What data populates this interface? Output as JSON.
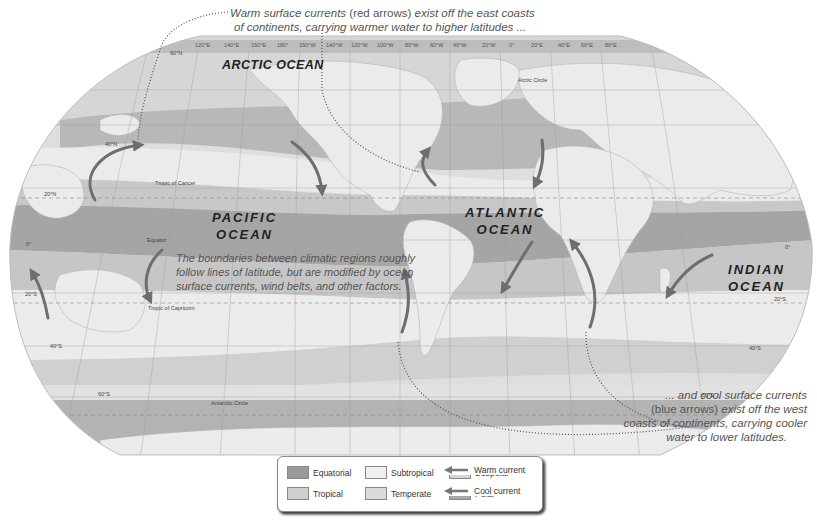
{
  "callouts": {
    "warm_line1_a": "Warm surface currents",
    "warm_line1_b": "(red arrows)",
    "warm_line1_c": "exist off the east coasts",
    "warm_line2": "of continents, carrying warmer water to higher latitudes ...",
    "cool_line1": "... and cool surface currents",
    "cool_line2_a": "(blue arrows)",
    "cool_line2_b": "exist off the west",
    "cool_line3": "coasts of continents,  carrying cooler",
    "cool_line4": "water to lower latitudes."
  },
  "oceans": {
    "arctic": "ARCTIC OCEAN",
    "pacific_1": "PACIFIC",
    "pacific_2": "OCEAN",
    "atlantic_1": "ATLANTIC",
    "atlantic_2": "OCEAN",
    "indian_1": "INDIAN",
    "indian_2": "OCEAN"
  },
  "note": {
    "line1": "The boundaries between climatic regions roughly",
    "line2": "follow lines of latitude, but are modified by ocean",
    "line3": "surface currents, wind belts, and other factors."
  },
  "reference_lines": {
    "tropic_cancer": "Tropic of Cancer",
    "tropic_capricorn": "Tropic of Capricorn",
    "equator": "Equator",
    "arctic_circle": "Arctic Circle",
    "antarctic_circle": "Antarctic Circle"
  },
  "latitudes": {
    "n60": "60°N",
    "n40": "40°N",
    "n20": "20°N",
    "eq_left": "0°",
    "eq_right": "0°",
    "s20_left": "20°S",
    "s20_right": "20°S",
    "s40_left": "40°S",
    "s40_right": "40°S",
    "s60_left": "60°S",
    "s60_right": "60°S"
  },
  "longitudes": [
    "120°E",
    "140°E",
    "160°E",
    "180°",
    "160°W",
    "140°W",
    "120°W",
    "100°W",
    "80°W",
    "60°W",
    "40°W",
    "20°W",
    "0°",
    "20°E",
    "40°E",
    "60°E",
    "80°E"
  ],
  "legend": {
    "items": [
      {
        "label": "Equatorial",
        "color": "#9a9a9a"
      },
      {
        "label": "Tropical",
        "color": "#cfcfcf"
      },
      {
        "label": "Subtropical",
        "color": "#f0f0f0"
      },
      {
        "label": "Temperate",
        "color": "#dadada"
      },
      {
        "label": "Subpolar",
        "color": "#d4d4d4"
      },
      {
        "label": "Polar",
        "color": "#a8a8a8"
      }
    ],
    "warm": "Warm current",
    "cool": "Cool current",
    "arrow_color": "#777777"
  },
  "colors": {
    "land": "#e9e9e9",
    "equatorial": "#a4a4a4",
    "tropical": "#c4c4c4",
    "subtropical": "#e6e6e6",
    "temperate": "#d2d2d2",
    "subpolar": "#cdcdcd",
    "polar": "#aeaeae",
    "current_arrow": "#6e6e6e"
  }
}
